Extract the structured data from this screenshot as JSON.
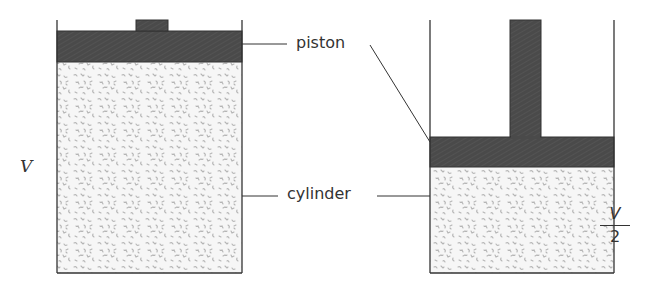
{
  "figure": {
    "labels": {
      "piston": "piston",
      "cylinder": "cylinder",
      "left_volume": "V",
      "right_volume_numerator": "V",
      "right_volume_denominator": "2"
    },
    "colors": {
      "piston_fill": "#4a4a4a",
      "gas_fill": "#f4f4f4",
      "gas_speckle": "#b8b8b8",
      "outline": "#333333"
    },
    "left_cylinder": {
      "state": "uncompressed",
      "volume": "V"
    },
    "right_cylinder": {
      "state": "compressed",
      "volume": "V/2"
    }
  }
}
